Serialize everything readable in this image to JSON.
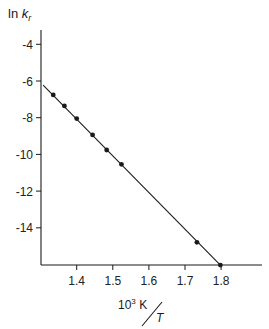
{
  "chart_data": {
    "type": "scatter",
    "title": "",
    "xlabel": "10^3 K / T",
    "ylabel": "ln k_r",
    "xlabel_parts": {
      "numerator": "10",
      "exponent": "3",
      "unit": "K",
      "denominator": "T"
    },
    "ylabel_parts": {
      "prefix": "ln ",
      "symbol": "k",
      "subscript": "r"
    },
    "xlim": [
      1.3,
      1.9
    ],
    "ylim": [
      -16,
      -3.2
    ],
    "x_ticks": [
      1.4,
      1.5,
      1.6,
      1.7,
      1.8
    ],
    "x_tick_labels": [
      "1.4",
      "1.5",
      "1.6",
      "1.7",
      "1.8"
    ],
    "y_ticks": [
      -4,
      -6,
      -8,
      -10,
      -12,
      -14
    ],
    "y_tick_labels": [
      "-4",
      "-6",
      "-8",
      "-10",
      "-12",
      "-14"
    ],
    "grid": false,
    "legend": null,
    "series": [
      {
        "name": "data",
        "marker": "filled-circle",
        "color": "#1a1a1a",
        "x": [
          1.335,
          1.366,
          1.4,
          1.444,
          1.483,
          1.524,
          1.733,
          1.798
        ],
        "y": [
          -6.76,
          -7.36,
          -8.05,
          -8.94,
          -9.76,
          -10.54,
          -14.79,
          -16.03
        ]
      },
      {
        "name": "linear fit",
        "style": "line",
        "color": "#1a1a1a",
        "x": [
          1.307,
          1.798
        ],
        "y": [
          -6.22,
          -16.03
        ]
      }
    ]
  },
  "labels": {
    "y_prefix": "ln ",
    "y_symbol": "k",
    "y_sub": "r",
    "x_num": "10",
    "x_exp": "3",
    "x_unit": " K",
    "x_den": "T"
  }
}
